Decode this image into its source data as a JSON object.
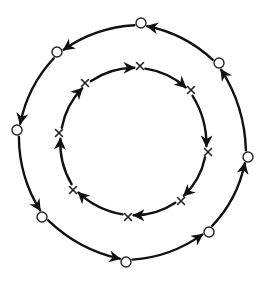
{
  "diagram": {
    "title": "",
    "background": "#ffffff",
    "stroke_color": "#111111",
    "outer_cycle": {
      "marker": "circle",
      "direction": "counter-clockwise",
      "nodes": [
        {
          "id": "o1",
          "x": 141,
          "y": 23
        },
        {
          "id": "o2",
          "x": 57,
          "y": 52
        },
        {
          "id": "o3",
          "x": 17,
          "y": 130
        },
        {
          "id": "o4",
          "x": 42,
          "y": 217
        },
        {
          "id": "o5",
          "x": 126,
          "y": 262
        },
        {
          "id": "o6",
          "x": 209,
          "y": 232
        },
        {
          "id": "o7",
          "x": 248,
          "y": 157
        },
        {
          "id": "o8",
          "x": 219,
          "y": 63
        }
      ],
      "radius": 5
    },
    "inner_cycle": {
      "marker": "cross",
      "direction": "clockwise",
      "nodes": [
        {
          "id": "x1",
          "x": 140,
          "y": 66
        },
        {
          "id": "x2",
          "x": 191,
          "y": 90
        },
        {
          "id": "x3",
          "x": 208,
          "y": 152
        },
        {
          "id": "x4",
          "x": 181,
          "y": 201
        },
        {
          "id": "x5",
          "x": 128,
          "y": 217
        },
        {
          "id": "x6",
          "x": 73,
          "y": 190
        },
        {
          "id": "x7",
          "x": 59,
          "y": 133
        },
        {
          "id": "x8",
          "x": 85,
          "y": 83
        }
      ],
      "size": 3.5
    },
    "center": {
      "x": 133,
      "y": 142
    }
  }
}
